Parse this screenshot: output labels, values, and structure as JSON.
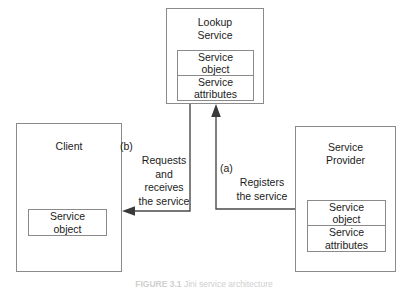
{
  "figure": {
    "caption_label": "FIGURE 3.1",
    "caption_text": "Jini service architecture",
    "caption_full": "FIGURE 3.1   Jini service architecture"
  },
  "colors": {
    "box_border": "#8a8a8a",
    "connector": "#4a4a4a",
    "arrowhead": "#3a3a3a",
    "text": "#1b1b1b",
    "background": "#ffffff"
  },
  "nodes": {
    "lookup_service": {
      "title": "Lookup\nService",
      "subboxes": [
        {
          "label": "Service\nobject"
        },
        {
          "label": "Service\nattributes"
        }
      ]
    },
    "client": {
      "title": "Client",
      "subboxes": [
        {
          "label": "Service\nobject"
        }
      ]
    },
    "service_provider": {
      "title": "Service\nProvider",
      "subboxes": [
        {
          "label": "Service\nobject"
        },
        {
          "label": "Service\nattributes"
        }
      ]
    }
  },
  "edges": [
    {
      "id": "a",
      "tag": "(a)",
      "label": "Registers\nthe service",
      "from": "service_provider",
      "to": "lookup_service"
    },
    {
      "id": "b",
      "tag": "(b)",
      "label": "Requests\nand\nreceives\nthe service",
      "from": "lookup_service",
      "to": "client"
    }
  ]
}
